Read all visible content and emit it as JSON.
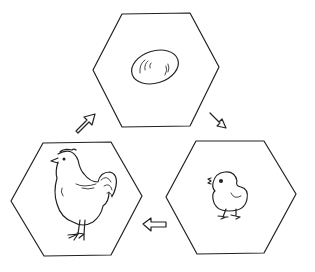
{
  "diagram": {
    "type": "life-cycle",
    "stages": [
      {
        "id": "egg",
        "label": "Egg",
        "position": "top"
      },
      {
        "id": "chick",
        "label": "Chick",
        "position": "bottom-right"
      },
      {
        "id": "hen",
        "label": "Chicken",
        "position": "bottom-left"
      }
    ],
    "arrows": [
      {
        "from": "egg",
        "to": "chick",
        "direction": "down-right"
      },
      {
        "from": "chick",
        "to": "hen",
        "direction": "left"
      },
      {
        "from": "hen",
        "to": "egg",
        "direction": "up-right"
      }
    ],
    "colors": {
      "line": "#222222",
      "background": "#ffffff"
    }
  }
}
